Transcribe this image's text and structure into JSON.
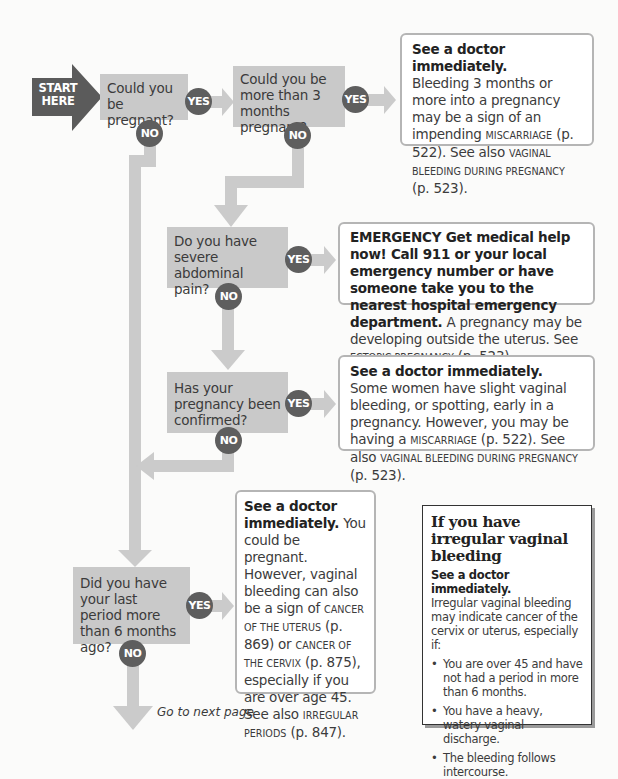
{
  "start": {
    "label_line1": "START",
    "label_line2": "HERE",
    "color": "#5b5b5b"
  },
  "colors": {
    "question_bg": "#c9c9c9",
    "connector": "#cbcbcb",
    "circle": "#5e5e5e",
    "result_border": "#b5b5b5"
  },
  "badges": {
    "yes": "YES",
    "no": "NO"
  },
  "questions": [
    {
      "id": "q1",
      "text": "Could you be pregnant?"
    },
    {
      "id": "q2",
      "text": "Could you be more than 3 months pregnant?"
    },
    {
      "id": "q3",
      "text": "Do you have severe abdominal pain?"
    },
    {
      "id": "q4",
      "text": "Has your pregnancy been confirmed?"
    },
    {
      "id": "q5",
      "text": "Did you have your last period more than 6 months ago?"
    }
  ],
  "results": [
    {
      "id": "r1",
      "heading": "See a doctor immediately.",
      "t1": "Bleeding 3 months or more into a pregnancy may be a sign of an impending ",
      "sc1": "Miscarriage",
      "t2": " (p. 522). See also ",
      "sc2": "Vaginal bleeding during pregnancy",
      "t3": " (p. 523)."
    },
    {
      "id": "r2",
      "heading": "EMERGENCY  Get medical help now! Call 911 or your local emergency number or have someone take you to the nearest hospital emergency department.",
      "t1": " A pregnancy may be developing outside the uterus. See ",
      "sc1": "Ectopic pregnancy",
      "t2": " (p. 523)."
    },
    {
      "id": "r3",
      "heading": "See a doctor immediately.",
      "t1": " Some women have slight vaginal bleeding, or spotting, early in a pregnancy. However, you may be having a ",
      "sc1": "Miscarriage",
      "t2": " (p. 522). See also ",
      "sc2": "Vaginal bleeding during pregnancy",
      "t3": " (p. 523)."
    },
    {
      "id": "r4",
      "heading": "See a doctor immediately.",
      "t1": " You could be pregnant. However, vaginal bleeding can also be a sign of ",
      "sc1": "Cancer of the uterus",
      "t2": " (p. 869) or ",
      "sc2": "Cancer of the cervix",
      "t3": " (p. 875), especially if you are over age 45. See also ",
      "sc3": "Irregular periods",
      "t4": " (p. 847)."
    }
  ],
  "next_page": "Go to next page",
  "sidebar": {
    "title": "If you have irregular vaginal bleeding",
    "subtitle": "See a doctor immediately.",
    "intro": "Irregular vaginal bleeding may indicate cancer of the cervix or uterus, especially if:",
    "bullets": [
      "You are over 45 and have not had a period in more than 6 months.",
      "You have a heavy, watery vaginal discharge.",
      "The bleeding follows intercourse."
    ]
  }
}
